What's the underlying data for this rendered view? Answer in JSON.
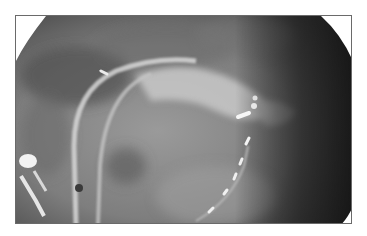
{
  "image": {
    "kind": "fluoroscopy x-ray",
    "description": "Grayscale fluoroscopic image showing catheters and a pacing lead with electrodes",
    "colors": {
      "background": "#ffffff",
      "frame_border": "#6a6a6a",
      "dark_field": "#2a2a2a",
      "mid_field": "#8a8a8a",
      "bright_device": "#f4f4f4"
    }
  }
}
